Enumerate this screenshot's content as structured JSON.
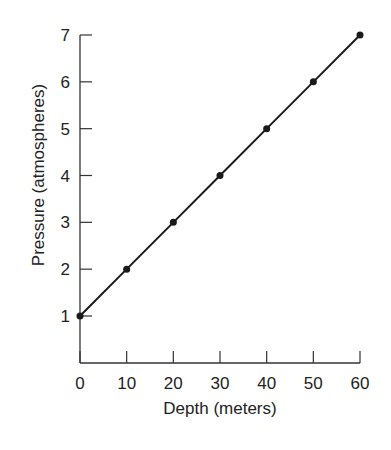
{
  "chart_data": {
    "type": "line",
    "title": "",
    "xlabel": "Depth (meters)",
    "ylabel": "Pressure (atmospheres)",
    "x": [
      0,
      10,
      20,
      30,
      40,
      50,
      60
    ],
    "series": [
      {
        "name": "Pressure",
        "values": [
          1,
          2,
          3,
          4,
          5,
          6,
          7
        ]
      }
    ],
    "xticks": [
      "0",
      "10",
      "20",
      "30",
      "40",
      "50",
      "60"
    ],
    "yticks": [
      "1",
      "2",
      "3",
      "4",
      "5",
      "6",
      "7"
    ],
    "xlim": [
      0,
      60
    ],
    "ylim": [
      0,
      7
    ],
    "grid": false,
    "legend": "none",
    "markers": true,
    "line_color": "#1a1a1a"
  }
}
